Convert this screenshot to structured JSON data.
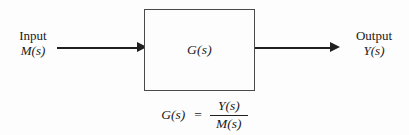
{
  "figure": {
    "type": "block-diagram",
    "background_color": "#fdfdfd",
    "line_color": "#1f1f1f",
    "box_border_color": "#4a4a4a",
    "text_color": "#1a1a1a"
  },
  "block": {
    "label": "G(s)",
    "x": 144,
    "y": 9,
    "width": 111,
    "height": 82
  },
  "input": {
    "name": "Input",
    "symbol": "M(s)",
    "arrow_direction": "right"
  },
  "output": {
    "name": "Output",
    "symbol": "Y(s)",
    "arrow_direction": "right"
  },
  "equation": {
    "lhs": "G(s)",
    "equals": "=",
    "numerator": "Y(s)",
    "denominator": "M(s)",
    "full_text": "G(s) = Y(s) / M(s)"
  }
}
